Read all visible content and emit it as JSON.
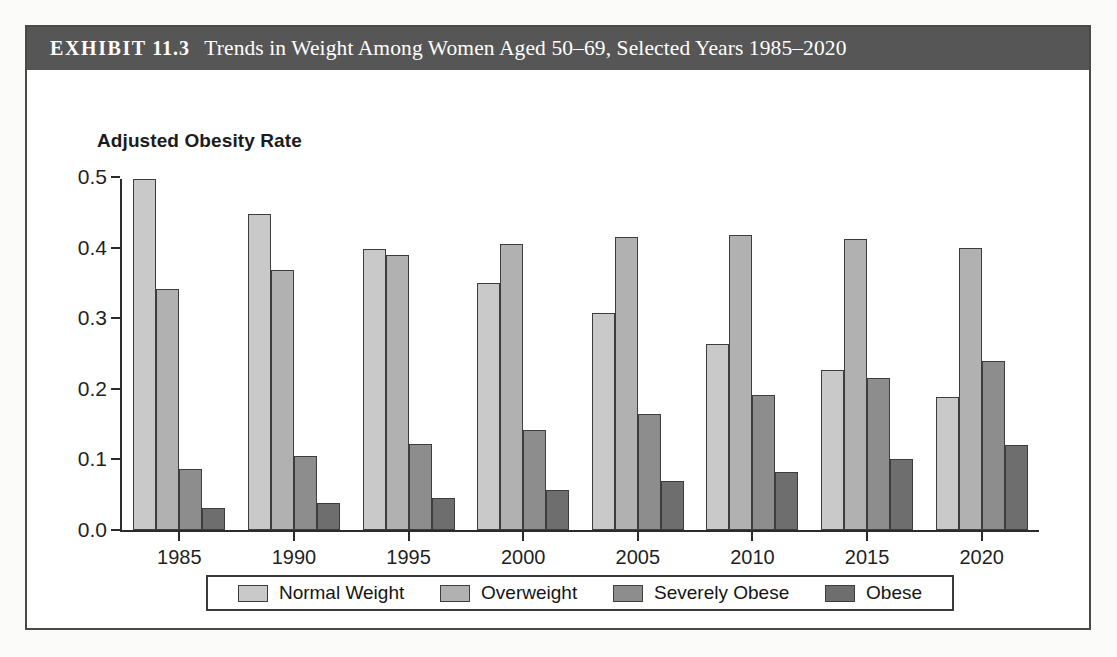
{
  "exhibit": {
    "label": "EXHIBIT",
    "number": "11.3",
    "title": "Trends in Weight Among Women Aged 50–69, Selected Years 1985–2020",
    "full_title": "EXHIBIT 11.3  Trends in Weight Among Women Aged 50–69, Selected Years 1985–2020"
  },
  "colors": {
    "title_bar": "#565656",
    "frame": "#4a4a4a",
    "axis": "#2b2b2b",
    "bar_border": "#3d3d3d",
    "normal_weight": "#c9c9c9",
    "overweight": "#b1b1b1",
    "severely_obese": "#8d8d8d",
    "obese": "#6e6e6e",
    "background": "#ffffff"
  },
  "chart_data": {
    "type": "bar",
    "title": "Adjusted Obesity Rate",
    "xlabel": "",
    "ylabel": "Adjusted Obesity Rate",
    "categories": [
      "1985",
      "1990",
      "1995",
      "2000",
      "2005",
      "2010",
      "2015",
      "2020"
    ],
    "ylim": [
      0.0,
      0.5
    ],
    "yticks": [
      "0.0",
      "0.1",
      "0.2",
      "0.3",
      "0.4",
      "0.5"
    ],
    "ytick_values": [
      0.0,
      0.1,
      0.2,
      0.3,
      0.4,
      0.5
    ],
    "grid": false,
    "legend_position": "bottom",
    "series": [
      {
        "name": "Normal Weight",
        "color": "#c9c9c9",
        "values": [
          0.497,
          0.447,
          0.398,
          0.35,
          0.307,
          0.264,
          0.226,
          0.188
        ]
      },
      {
        "name": "Overweight",
        "color": "#b1b1b1",
        "values": [
          0.341,
          0.368,
          0.389,
          0.405,
          0.415,
          0.418,
          0.412,
          0.4
        ]
      },
      {
        "name": "Severely Obese",
        "color": "#8d8d8d",
        "values": [
          0.087,
          0.105,
          0.122,
          0.142,
          0.165,
          0.191,
          0.215,
          0.24
        ]
      },
      {
        "name": "Obese",
        "color": "#6e6e6e",
        "values": [
          0.031,
          0.038,
          0.046,
          0.057,
          0.069,
          0.082,
          0.1,
          0.121
        ]
      }
    ]
  }
}
